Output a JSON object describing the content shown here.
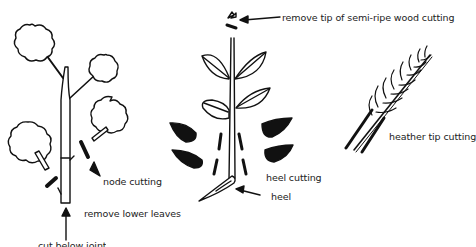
{
  "diagram": {
    "labels": {
      "remove_tip": "remove tip of semi-ripe wood cutting",
      "node_cutting": "node cutting",
      "remove_lower_leaves": "remove lower leaves",
      "cut_below_joint": "cut below joint",
      "heel_cutting": "heel cutting",
      "heel": "heel",
      "heather_tip_cutting": "heather tip cutting"
    },
    "colors": {
      "ink": "#111111",
      "background": "#ffffff"
    }
  }
}
